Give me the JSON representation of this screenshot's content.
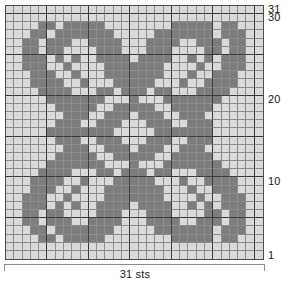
{
  "chart_data": {
    "type": "heatmap",
    "title": "",
    "xlabel": "31 sts",
    "ylabel": "",
    "columns": 31,
    "rows": 31,
    "legend": [
      {
        "key": 0,
        "label": "background",
        "color": "#d9d9d9"
      },
      {
        "key": 1,
        "label": "motif",
        "color": "#7d7d7d"
      }
    ],
    "x_tick_labels": [],
    "y_tick_labels": [
      "31",
      "30",
      "20",
      "10",
      "1"
    ],
    "grid": true,
    "heavy_rule_every": 5,
    "values": [
      [
        0,
        0,
        0,
        0,
        0,
        0,
        0,
        0,
        0,
        0,
        0,
        0,
        0,
        0,
        0,
        0,
        0,
        0,
        0,
        0,
        0,
        0,
        0,
        0,
        0,
        0,
        0,
        0,
        0,
        0,
        0
      ],
      [
        0,
        0,
        0,
        0,
        0,
        0,
        0,
        0,
        0,
        0,
        0,
        0,
        0,
        0,
        0,
        0,
        0,
        0,
        0,
        0,
        0,
        0,
        0,
        0,
        0,
        0,
        0,
        0,
        0,
        0,
        0
      ],
      [
        0,
        0,
        0,
        0,
        1,
        1,
        0,
        1,
        1,
        1,
        1,
        1,
        0,
        0,
        0,
        0,
        0,
        0,
        0,
        0,
        1,
        1,
        1,
        1,
        1,
        0,
        1,
        1,
        0,
        0,
        0
      ],
      [
        0,
        0,
        0,
        1,
        1,
        0,
        1,
        1,
        1,
        1,
        1,
        1,
        1,
        0,
        0,
        0,
        0,
        0,
        1,
        1,
        1,
        1,
        1,
        1,
        1,
        0,
        1,
        1,
        1,
        0,
        0
      ],
      [
        0,
        0,
        1,
        1,
        0,
        1,
        1,
        1,
        0,
        0,
        1,
        1,
        1,
        1,
        0,
        0,
        0,
        1,
        1,
        1,
        1,
        0,
        0,
        1,
        1,
        1,
        0,
        1,
        1,
        0,
        0
      ],
      [
        0,
        0,
        1,
        1,
        0,
        1,
        1,
        0,
        0,
        0,
        0,
        1,
        1,
        1,
        0,
        0,
        0,
        1,
        1,
        1,
        0,
        0,
        0,
        0,
        1,
        1,
        0,
        1,
        1,
        0,
        0
      ],
      [
        0,
        0,
        1,
        1,
        1,
        0,
        1,
        0,
        1,
        0,
        0,
        1,
        1,
        1,
        1,
        0,
        1,
        1,
        1,
        1,
        0,
        0,
        1,
        0,
        1,
        0,
        1,
        1,
        1,
        0,
        0
      ],
      [
        0,
        0,
        1,
        1,
        1,
        0,
        0,
        1,
        0,
        0,
        0,
        0,
        1,
        1,
        1,
        1,
        1,
        1,
        1,
        0,
        0,
        0,
        0,
        1,
        0,
        0,
        1,
        1,
        1,
        0,
        0
      ],
      [
        0,
        0,
        0,
        1,
        1,
        1,
        0,
        0,
        1,
        0,
        0,
        0,
        1,
        1,
        1,
        1,
        1,
        1,
        1,
        0,
        0,
        0,
        1,
        0,
        0,
        1,
        1,
        1,
        0,
        0,
        0
      ],
      [
        0,
        0,
        0,
        1,
        1,
        1,
        1,
        0,
        0,
        1,
        0,
        0,
        0,
        1,
        1,
        1,
        1,
        1,
        0,
        0,
        0,
        1,
        0,
        0,
        1,
        1,
        1,
        1,
        0,
        0,
        0
      ],
      [
        0,
        0,
        0,
        0,
        1,
        1,
        1,
        1,
        0,
        0,
        0,
        1,
        1,
        0,
        1,
        1,
        1,
        0,
        1,
        1,
        0,
        0,
        0,
        1,
        1,
        1,
        1,
        0,
        0,
        0,
        0
      ],
      [
        0,
        0,
        0,
        0,
        0,
        1,
        1,
        1,
        1,
        1,
        1,
        1,
        0,
        0,
        0,
        1,
        0,
        0,
        0,
        1,
        1,
        1,
        1,
        1,
        1,
        1,
        0,
        0,
        0,
        0,
        0
      ],
      [
        0,
        0,
        0,
        0,
        0,
        0,
        1,
        1,
        1,
        1,
        1,
        0,
        0,
        1,
        1,
        1,
        1,
        1,
        0,
        0,
        1,
        1,
        1,
        1,
        1,
        0,
        0,
        0,
        0,
        0,
        0
      ],
      [
        0,
        0,
        0,
        0,
        0,
        0,
        0,
        1,
        1,
        1,
        0,
        0,
        1,
        1,
        1,
        0,
        1,
        1,
        1,
        0,
        0,
        1,
        1,
        1,
        0,
        0,
        0,
        0,
        0,
        0,
        0
      ],
      [
        0,
        0,
        0,
        0,
        0,
        0,
        1,
        1,
        1,
        0,
        0,
        1,
        1,
        1,
        0,
        0,
        0,
        1,
        1,
        1,
        0,
        0,
        1,
        1,
        1,
        0,
        0,
        0,
        0,
        0,
        0
      ],
      [
        0,
        0,
        0,
        0,
        0,
        1,
        1,
        1,
        1,
        1,
        1,
        1,
        1,
        0,
        0,
        0,
        0,
        0,
        1,
        1,
        1,
        1,
        1,
        1,
        1,
        0,
        0,
        0,
        0,
        0,
        0
      ],
      [
        0,
        0,
        0,
        0,
        0,
        0,
        1,
        1,
        1,
        0,
        0,
        1,
        1,
        1,
        0,
        0,
        0,
        1,
        1,
        1,
        0,
        0,
        1,
        1,
        1,
        0,
        0,
        0,
        0,
        0,
        0
      ],
      [
        0,
        0,
        0,
        0,
        0,
        0,
        0,
        1,
        1,
        1,
        0,
        0,
        1,
        1,
        1,
        0,
        1,
        1,
        1,
        0,
        0,
        1,
        1,
        1,
        0,
        0,
        0,
        0,
        0,
        0,
        0
      ],
      [
        0,
        0,
        0,
        0,
        0,
        0,
        1,
        1,
        1,
        1,
        1,
        0,
        0,
        1,
        1,
        1,
        1,
        1,
        0,
        0,
        1,
        1,
        1,
        1,
        1,
        0,
        0,
        0,
        0,
        0,
        0
      ],
      [
        0,
        0,
        0,
        0,
        0,
        1,
        1,
        1,
        1,
        1,
        1,
        1,
        0,
        0,
        0,
        1,
        0,
        0,
        0,
        1,
        1,
        1,
        1,
        1,
        1,
        1,
        0,
        0,
        0,
        0,
        0
      ],
      [
        0,
        0,
        0,
        0,
        1,
        1,
        1,
        1,
        0,
        0,
        0,
        1,
        1,
        0,
        1,
        1,
        1,
        0,
        1,
        1,
        0,
        0,
        0,
        1,
        1,
        1,
        1,
        0,
        0,
        0,
        0
      ],
      [
        0,
        0,
        0,
        1,
        1,
        1,
        1,
        0,
        0,
        1,
        0,
        0,
        0,
        1,
        1,
        1,
        1,
        1,
        0,
        0,
        0,
        1,
        0,
        0,
        1,
        1,
        1,
        1,
        0,
        0,
        0
      ],
      [
        0,
        0,
        0,
        1,
        1,
        1,
        0,
        0,
        1,
        0,
        0,
        0,
        1,
        1,
        1,
        1,
        1,
        1,
        1,
        0,
        0,
        0,
        1,
        0,
        0,
        1,
        1,
        1,
        0,
        0,
        0
      ],
      [
        0,
        0,
        1,
        1,
        1,
        0,
        0,
        1,
        0,
        0,
        0,
        0,
        1,
        1,
        1,
        1,
        1,
        1,
        1,
        0,
        0,
        0,
        0,
        1,
        0,
        0,
        1,
        1,
        1,
        0,
        0
      ],
      [
        0,
        0,
        1,
        1,
        1,
        0,
        1,
        0,
        1,
        0,
        0,
        1,
        1,
        1,
        1,
        0,
        1,
        1,
        1,
        1,
        0,
        0,
        1,
        0,
        1,
        0,
        1,
        1,
        1,
        0,
        0
      ],
      [
        0,
        0,
        1,
        1,
        0,
        1,
        1,
        0,
        0,
        0,
        0,
        1,
        1,
        1,
        0,
        0,
        0,
        1,
        1,
        1,
        0,
        0,
        0,
        0,
        1,
        1,
        0,
        1,
        1,
        0,
        0
      ],
      [
        0,
        0,
        1,
        1,
        0,
        1,
        1,
        1,
        0,
        0,
        1,
        1,
        1,
        1,
        0,
        0,
        0,
        1,
        1,
        1,
        1,
        0,
        0,
        1,
        1,
        1,
        0,
        1,
        1,
        0,
        0
      ],
      [
        0,
        0,
        0,
        1,
        1,
        0,
        1,
        1,
        1,
        1,
        1,
        1,
        1,
        0,
        0,
        0,
        0,
        0,
        1,
        1,
        1,
        1,
        1,
        1,
        1,
        0,
        1,
        1,
        1,
        0,
        0
      ],
      [
        0,
        0,
        0,
        0,
        1,
        1,
        0,
        1,
        1,
        1,
        1,
        1,
        0,
        0,
        0,
        0,
        0,
        0,
        0,
        0,
        1,
        1,
        1,
        1,
        1,
        0,
        1,
        1,
        0,
        0,
        0
      ],
      [
        0,
        0,
        0,
        0,
        0,
        0,
        0,
        0,
        0,
        0,
        0,
        0,
        0,
        0,
        0,
        0,
        0,
        0,
        0,
        0,
        0,
        0,
        0,
        0,
        0,
        0,
        0,
        0,
        0,
        0,
        0
      ],
      [
        0,
        0,
        0,
        0,
        0,
        0,
        0,
        0,
        0,
        0,
        0,
        0,
        0,
        0,
        0,
        0,
        0,
        0,
        0,
        0,
        0,
        0,
        0,
        0,
        0,
        0,
        0,
        0,
        0,
        0,
        0
      ]
    ]
  },
  "axis": {
    "row_labels": [
      {
        "text": "31",
        "row": 31
      },
      {
        "text": "30",
        "row": 30
      },
      {
        "text": "20",
        "row": 20
      },
      {
        "text": "10",
        "row": 10
      },
      {
        "text": "1",
        "row": 1
      }
    ],
    "bottom_caption": "31 sts"
  }
}
